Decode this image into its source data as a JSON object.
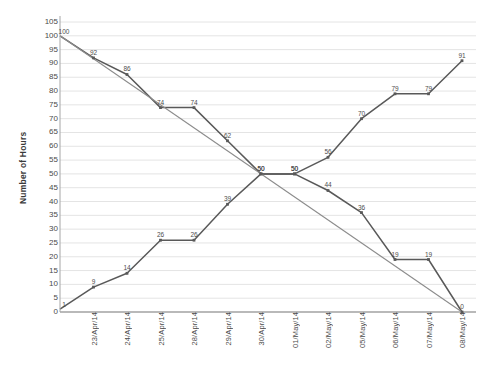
{
  "chart_data": {
    "type": "line",
    "title": "",
    "xlabel": "",
    "ylabel": "Number of Hours",
    "ylim": [
      0,
      105
    ],
    "ytick_step": 5,
    "grid": true,
    "legend": "none",
    "categories": [
      "23/Apr/14",
      "24/Apr/14",
      "25/Apr/14",
      "28/Apr/14",
      "29/Apr/14",
      "30/Apr/14",
      "01/May/14",
      "02/May/14",
      "05/May/14",
      "06/May/14",
      "07/May/14",
      "08/May/14"
    ],
    "yticks": [
      0,
      5,
      10,
      15,
      20,
      25,
      30,
      35,
      40,
      45,
      50,
      55,
      60,
      65,
      70,
      75,
      80,
      85,
      90,
      95,
      100,
      105
    ],
    "series": [
      {
        "name": "remaining-hours",
        "color": "#595959",
        "start_at_axis": true,
        "start_value": 100,
        "values": [
          92,
          86,
          74,
          74,
          62,
          50,
          50,
          44,
          36,
          19,
          19,
          0
        ],
        "labels": [
          "92",
          "86",
          "74",
          "74",
          "62",
          "50",
          "50",
          "44",
          "36",
          "19",
          "19",
          "0"
        ],
        "start_label": "100"
      },
      {
        "name": "completed-hours",
        "color": "#595959",
        "start_at_axis": true,
        "start_value": 1,
        "values": [
          9,
          14,
          26,
          26,
          39,
          50,
          50,
          56,
          70,
          79,
          79,
          91
        ],
        "labels": [
          "9",
          "14",
          "26",
          "26",
          "39",
          "50",
          "50",
          "56",
          "70",
          "79",
          "79",
          "91"
        ],
        "start_label": "1"
      },
      {
        "name": "ideal-trend-line",
        "color": "#8c8c8c",
        "start_at_axis": true,
        "start_value": 100,
        "values": [
          null,
          null,
          null,
          null,
          null,
          null,
          null,
          null,
          null,
          null,
          null,
          0
        ],
        "labels": [],
        "start_label": ""
      }
    ]
  },
  "axis": {
    "y_title": "Number of Hours"
  },
  "style": {
    "grid_color": "#e4e4e4",
    "axis_color": "#a6a6a6",
    "plot_background": "#ffffff",
    "line_dark": "#595959",
    "line_light": "#8c8c8c",
    "text_color": "#4a4a4a"
  }
}
